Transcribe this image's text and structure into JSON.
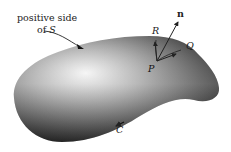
{
  "labels": {
    "positive_side_line1": "positive side",
    "positive_side_line2_prefix": "of ",
    "positive_side_S": "S",
    "normal": "n",
    "R": "R",
    "Q": "Q",
    "P": "P",
    "curve": "C"
  },
  "colors": {
    "surface_dark": "#1a1a1a",
    "surface_mid": "#6e6e6e",
    "surface_light": "#f2f2f2",
    "ink": "#222222"
  }
}
